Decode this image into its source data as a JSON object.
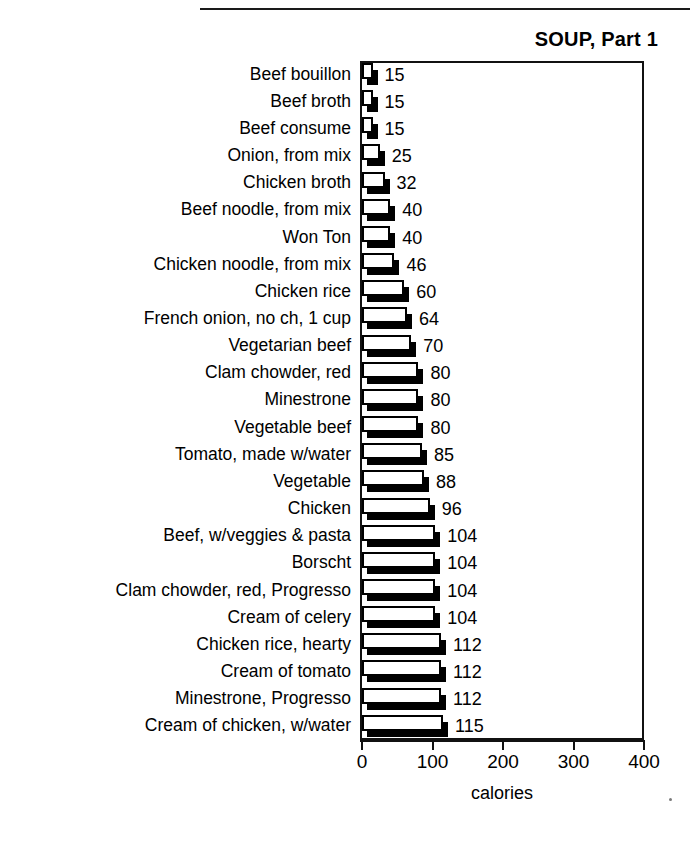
{
  "chart_data": {
    "type": "bar",
    "orientation": "horizontal",
    "title": "SOUP, Part 1",
    "xlabel": "calories",
    "ylabel": "",
    "xlim": [
      0,
      400
    ],
    "xticks": [
      0,
      100,
      200,
      300,
      400
    ],
    "grid": false,
    "legend": null,
    "bar_style": "3d-shadow-white-face",
    "categories": [
      "Beef bouillon",
      "Beef broth",
      "Beef consume",
      "Onion, from mix",
      "Chicken broth",
      "Beef noodle, from mix",
      "Won Ton",
      "Chicken noodle, from mix",
      "Chicken rice",
      "French onion, no ch, 1 cup",
      "Vegetarian beef",
      "Clam chowder, red",
      "Minestrone",
      "Vegetable beef",
      "Tomato, made w/water",
      "Vegetable",
      "Chicken",
      "Beef, w/veggies & pasta",
      "Borscht",
      "Clam chowder, red, Progresso",
      "Cream of celery",
      "Chicken rice, hearty",
      "Cream of tomato",
      "Minestrone, Progresso",
      "Cream of chicken, w/water"
    ],
    "values": [
      15,
      15,
      15,
      25,
      32,
      40,
      40,
      46,
      60,
      64,
      70,
      80,
      80,
      80,
      85,
      88,
      96,
      104,
      104,
      104,
      104,
      112,
      112,
      112,
      115
    ],
    "data_labels": [
      "15",
      "15",
      "15",
      "25",
      "32",
      "40",
      "40",
      "46",
      "60",
      "64",
      "70",
      "80",
      "80",
      "80",
      "85",
      "88",
      "96",
      "104",
      "104",
      "104",
      "104",
      "112",
      "112",
      "112",
      "115"
    ]
  },
  "axis": {
    "tick_labels": [
      "0",
      "100",
      "200",
      "300",
      "400"
    ],
    "title": "calories"
  },
  "colors": {
    "bar_face": "#ffffff",
    "bar_outline": "#000000",
    "bar_shadow": "#000000",
    "text": "#000000",
    "frame": "#111111"
  }
}
